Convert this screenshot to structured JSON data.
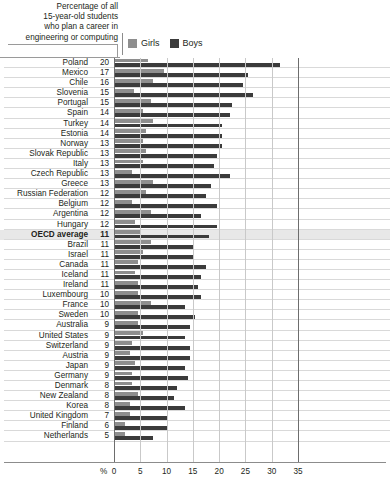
{
  "header": {
    "title_lines": [
      "Percentage of all",
      "15-year-old students",
      "who plan a career in",
      "engineering or computing"
    ],
    "legend": [
      {
        "label": "Girls",
        "color": "#8e8e8e",
        "icon": "legend-swatch-girls"
      },
      {
        "label": "Boys",
        "color": "#3b3b3b",
        "icon": "legend-swatch-boys"
      }
    ]
  },
  "axis": {
    "unit_label": "%",
    "ticks": [
      "0",
      "5",
      "10",
      "15",
      "20",
      "25",
      "30",
      "35"
    ],
    "min": 0,
    "max": 35
  },
  "chart_data": {
    "type": "bar",
    "xlabel": "%",
    "ylabel": "",
    "xlim": [
      0,
      35
    ],
    "grid": true,
    "orientation": "horizontal",
    "legend_position": "top-right",
    "categories": [
      "Poland",
      "Mexico",
      "Chile",
      "Slovenia",
      "Portugal",
      "Spain",
      "Turkey",
      "Estonia",
      "Norway",
      "Slovak Republic",
      "Italy",
      "Czech Republic",
      "Greece",
      "Russian Federation",
      "Belgium",
      "Argentina",
      "Hungary",
      "OECD average",
      "Brazil",
      "Israel",
      "Canada",
      "Iceland",
      "Ireland",
      "Luxembourg",
      "France",
      "Sweden",
      "Australia",
      "United States",
      "Switzerland",
      "Austria",
      "Japan",
      "Germany",
      "Denmark",
      "New Zealand",
      "Korea",
      "United Kingdom",
      "Finland",
      "Netherlands"
    ],
    "total_values": [
      20,
      17,
      16,
      15,
      15,
      14,
      14,
      14,
      13,
      13,
      13,
      13,
      13,
      12,
      12,
      12,
      12,
      11,
      11,
      11,
      11,
      11,
      11,
      10,
      10,
      10,
      9,
      9,
      9,
      9,
      9,
      9,
      8,
      8,
      8,
      7,
      6,
      5
    ],
    "series": [
      {
        "name": "Girls",
        "color": "#8e8e8e",
        "values": [
          6.5,
          9.5,
          7.5,
          3.8,
          7.0,
          5.5,
          7.5,
          6.0,
          5.5,
          6.0,
          5.5,
          3.5,
          7.5,
          6.0,
          3.5,
          7.0,
          4.0,
          5.0,
          7.0,
          5.5,
          4.5,
          4.0,
          4.5,
          4.5,
          7.0,
          4.5,
          4.5,
          5.5,
          3.5,
          3.0,
          4.0,
          3.5,
          3.5,
          4.5,
          3.0,
          3.0,
          2.0,
          2.0
        ]
      },
      {
        "name": "Boys",
        "color": "#3b3b3b",
        "values": [
          31.5,
          25.5,
          24.5,
          26.5,
          22.5,
          22.0,
          20.5,
          20.5,
          20.5,
          19.5,
          19.0,
          22.0,
          18.5,
          17.5,
          19.5,
          16.5,
          19.5,
          18.0,
          15.0,
          15.0,
          17.5,
          16.5,
          16.0,
          16.5,
          13.5,
          15.5,
          14.5,
          13.5,
          14.5,
          14.5,
          13.5,
          14.0,
          12.0,
          11.5,
          13.5,
          10.0,
          10.0,
          7.5
        ]
      }
    ]
  }
}
